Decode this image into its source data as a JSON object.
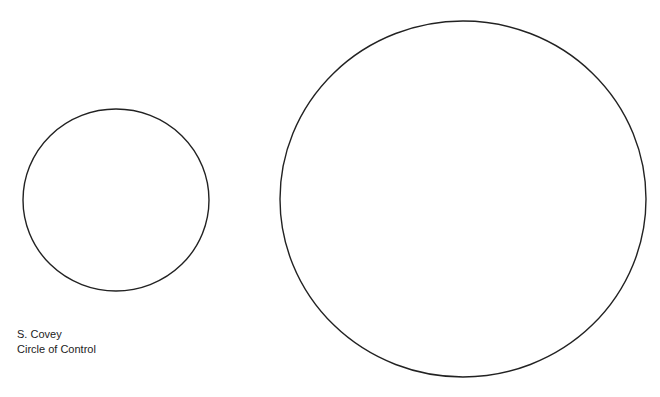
{
  "diagram": {
    "circles": [
      {
        "name": "small-circle",
        "cx": 116,
        "cy": 200,
        "rx": 93,
        "ry": 91
      },
      {
        "name": "large-circle",
        "cx": 463,
        "cy": 199,
        "rx": 183,
        "ry": 178
      }
    ],
    "stroke_color": "#222222",
    "background": "#ffffff"
  },
  "caption": {
    "author": "S. Covey",
    "title": "Circle of Control"
  }
}
